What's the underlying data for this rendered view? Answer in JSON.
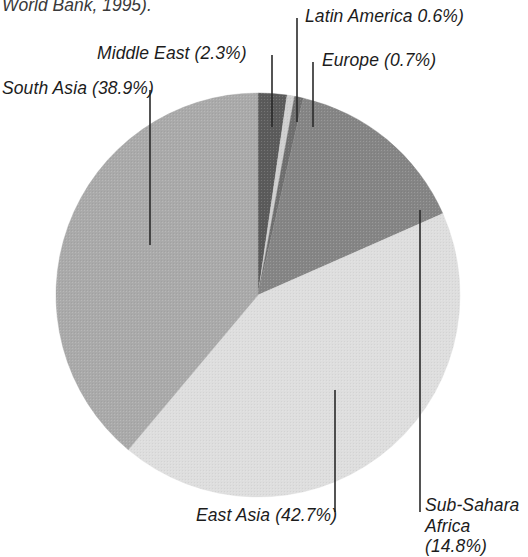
{
  "figure": {
    "clipped_header": "World Bank, 1995).",
    "background_color": "#ffffff",
    "text_color": "#1c1c1c"
  },
  "chart_data": {
    "type": "pie",
    "title": "",
    "subtitle": "",
    "xlabel": "",
    "ylabel": "",
    "grid": false,
    "legend_position": "none",
    "label_format": "name (value%)",
    "units": "percent",
    "total": 100.0,
    "categories": [
      "Middle East",
      "Latin America",
      "Europe",
      "Sub-Sahara Africa",
      "East Asia",
      "South Asia"
    ],
    "values": [
      2.3,
      0.6,
      0.7,
      14.8,
      42.7,
      38.9
    ],
    "colors": [
      "#5b5b5b",
      "#cfcfcf",
      "#6f6f6f",
      "#858585",
      "#dedede",
      "#aaaaaa"
    ],
    "slices": [
      {
        "name": "Middle East",
        "value": 2.3,
        "label": "Middle East (2.3%)",
        "color": "#5b5b5b",
        "start_angle_deg": 0.0,
        "end_angle_deg": 8.28
      },
      {
        "name": "Latin America",
        "value": 0.6,
        "label": "Latin America 0.6%)",
        "color": "#cfcfcf",
        "start_angle_deg": 8.28,
        "end_angle_deg": 10.44
      },
      {
        "name": "Europe",
        "value": 0.7,
        "label": "Europe (0.7%)",
        "color": "#6f6f6f",
        "start_angle_deg": 10.44,
        "end_angle_deg": 12.96
      },
      {
        "name": "Sub-Sahara Africa",
        "value": 14.8,
        "label": "Sub-Sahara\nAfrica (14.8%)",
        "color": "#858585",
        "start_angle_deg": 12.96,
        "end_angle_deg": 66.24
      },
      {
        "name": "East Asia",
        "value": 42.7,
        "label": "East Asia (42.7%)",
        "color": "#dedede",
        "start_angle_deg": 66.24,
        "end_angle_deg": 219.96
      },
      {
        "name": "South Asia",
        "value": 38.9,
        "label": "South Asia (38.9%)",
        "color": "#aaaaaa",
        "start_angle_deg": 219.96,
        "end_angle_deg": 360.0
      }
    ],
    "geometry": {
      "center_x": 258,
      "center_y": 295,
      "radius": 202
    }
  },
  "labels": {
    "south_asia": "South Asia (38.9%)",
    "middle_east": "Middle East (2.3%)",
    "latin_america": "Latin America 0.6%)",
    "europe": "Europe (0.7%)",
    "east_asia": "East Asia (42.7%)",
    "sub_sahara": "Sub-Sahara\nAfrica (14.8%)"
  },
  "leaders": [
    {
      "name": "south-asia",
      "x1": 150,
      "y1": 90,
      "x2": 150,
      "y2": 245
    },
    {
      "name": "middle-east",
      "x1": 272,
      "y1": 55,
      "x2": 272,
      "y2": 127
    },
    {
      "name": "latin-america",
      "x1": 297,
      "y1": 18,
      "x2": 297,
      "y2": 122
    },
    {
      "name": "europe",
      "x1": 313,
      "y1": 62,
      "x2": 313,
      "y2": 127
    },
    {
      "name": "east-asia",
      "x1": 335,
      "y1": 390,
      "x2": 335,
      "y2": 512
    },
    {
      "name": "sub-sahara",
      "x1": 420,
      "y1": 210,
      "x2": 420,
      "y2": 512
    }
  ]
}
